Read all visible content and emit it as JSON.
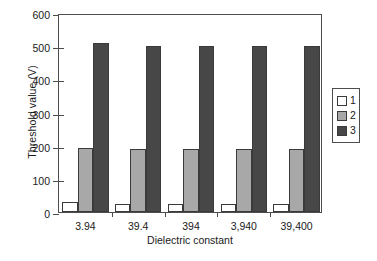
{
  "chart_data": {
    "type": "bar",
    "title": "",
    "xlabel": "Dielectric constant",
    "ylabel": "Threshold value (V)",
    "categories": [
      "3.94",
      "39.4",
      "394",
      "3,940",
      "39,400"
    ],
    "series": [
      {
        "name": "1",
        "values": [
          30,
          25,
          25,
          25,
          25
        ],
        "color": "#ffffff"
      },
      {
        "name": "2",
        "values": [
          192,
          190,
          190,
          190,
          190
        ],
        "color": "#a8a8a8"
      },
      {
        "name": "3",
        "values": [
          510,
          500,
          500,
          500,
          500
        ],
        "color": "#474747"
      }
    ],
    "ylim": [
      0,
      600
    ],
    "yticks": [
      0,
      100,
      200,
      300,
      400,
      500,
      600
    ],
    "ytick_labels": [
      "0",
      "100",
      "200",
      "300",
      "400",
      "500",
      "600"
    ],
    "grid": false,
    "legend_position": "right-outside",
    "legend_entries": [
      "1",
      "2",
      "3"
    ],
    "axis_color": "#4d4d4d",
    "bar_edge_color": "#3a3a3a"
  }
}
